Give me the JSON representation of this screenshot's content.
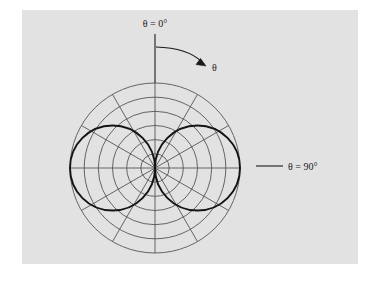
{
  "figure": {
    "kind": "polar-radiation-pattern",
    "background_color": "#ffffff",
    "panel_color": "#e2e2e2",
    "grid_color": "#55555a",
    "curve_color": "#141414",
    "label_color": "#1a1a1a",
    "labels": {
      "theta_zero": "θ = 0°",
      "theta_ninety": "θ = 90°",
      "theta_arrow": "θ"
    }
  },
  "chart_data": {
    "type": "line",
    "subtype": "polar",
    "title": "",
    "xlabel": "",
    "ylabel": "",
    "grid": true,
    "legend": null,
    "polar": {
      "center_x": 155,
      "center_y": 168,
      "outer_radius": 85,
      "ring_count": 6,
      "ring_radii": [
        14.2,
        28.3,
        42.5,
        56.7,
        70.8,
        85.0
      ],
      "spoke_count": 12,
      "spoke_step_deg": 30,
      "spoke_angles_deg": [
        0,
        30,
        60,
        90,
        120,
        150,
        180,
        210,
        240,
        270,
        300,
        330
      ],
      "angle_origin": "top",
      "angle_direction": "clockwise",
      "rlim": [
        0,
        1
      ]
    },
    "series": [
      {
        "name": "|sin θ| pattern",
        "formula": "r = |sin(θ)|",
        "theta_deg": [
          0,
          10,
          20,
          30,
          40,
          50,
          60,
          70,
          80,
          90,
          100,
          110,
          120,
          130,
          140,
          150,
          160,
          170,
          180,
          190,
          200,
          210,
          220,
          230,
          240,
          250,
          260,
          270,
          280,
          290,
          300,
          310,
          320,
          330,
          340,
          350,
          360
        ],
        "r": [
          0.0,
          0.174,
          0.342,
          0.5,
          0.643,
          0.766,
          0.866,
          0.94,
          0.985,
          1.0,
          0.985,
          0.94,
          0.866,
          0.766,
          0.643,
          0.5,
          0.342,
          0.174,
          0.0,
          0.174,
          0.342,
          0.5,
          0.643,
          0.766,
          0.866,
          0.94,
          0.985,
          1.0,
          0.985,
          0.94,
          0.866,
          0.766,
          0.643,
          0.5,
          0.342,
          0.174,
          0.0
        ],
        "r_max": 1.0,
        "lobes": 2,
        "lobe_peak_angles_deg": [
          90,
          270
        ]
      }
    ],
    "annotations": [
      {
        "id": "theta-zero-axis",
        "text": "θ = 0°",
        "at_angle_deg": 0,
        "x": 155,
        "y": 25,
        "leader": "vertical line from y=34 to y=83"
      },
      {
        "id": "theta-direction-arrow",
        "text": "θ",
        "x": 214,
        "y": 68,
        "leader": "curved arc from (155,47) sweeping clockwise to (202,64)"
      },
      {
        "id": "theta-ninety-axis",
        "text": "θ = 90°",
        "at_angle_deg": 90,
        "x": 292,
        "y": 168,
        "leader": "horizontal line from x=255 to x=283 at y=166"
      }
    ]
  }
}
